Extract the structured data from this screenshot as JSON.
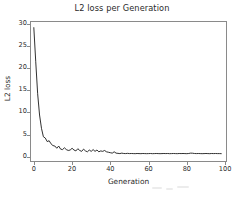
{
  "chart_data": {
    "type": "line",
    "title": "L2 loss per Generation",
    "xlabel": "Generation",
    "ylabel": "L2 loss",
    "grid": false,
    "legend": null,
    "line_color": "#1a1a1a",
    "background_color": "#ffffff",
    "axis_color": "#8a8a8a",
    "xlim": [
      -2,
      101
    ],
    "ylim": [
      -1.2,
      30.6
    ],
    "xticks": [
      0,
      20,
      40,
      60,
      80,
      100
    ],
    "xtick_labels": [
      "0",
      "20",
      "40",
      "60",
      "80",
      "100"
    ],
    "yticks": [
      0,
      5,
      10,
      15,
      20,
      25,
      30
    ],
    "ytick_labels": [
      "0",
      "5",
      "10",
      "15",
      "20",
      "25",
      "30"
    ],
    "series": [
      {
        "name": "L2 loss",
        "x": [
          0,
          1,
          2,
          3,
          4,
          5,
          6,
          7,
          8,
          9,
          10,
          11,
          12,
          13,
          14,
          15,
          16,
          17,
          18,
          19,
          20,
          21,
          22,
          23,
          24,
          25,
          26,
          27,
          28,
          29,
          30,
          31,
          32,
          33,
          34,
          35,
          36,
          37,
          38,
          39,
          40,
          41,
          42,
          43,
          44,
          45,
          46,
          47,
          48,
          49,
          50,
          51,
          52,
          53,
          54,
          55,
          56,
          57,
          58,
          59,
          60,
          61,
          62,
          63,
          64,
          65,
          66,
          67,
          68,
          69,
          70,
          71,
          72,
          73,
          74,
          75,
          76,
          77,
          78,
          79,
          80,
          81,
          82,
          83,
          84,
          85,
          86,
          87,
          88,
          89,
          90,
          91,
          92,
          93,
          94,
          95,
          96,
          97,
          98
        ],
        "y": [
          29.1,
          21.4,
          14.2,
          9.4,
          6.4,
          4.5,
          4.2,
          3.4,
          3.6,
          2.9,
          2.5,
          2.4,
          1.9,
          2.4,
          1.7,
          1.6,
          2.0,
          1.6,
          1.4,
          1.5,
          1.9,
          1.5,
          1.3,
          1.8,
          1.4,
          1.2,
          1.7,
          1.3,
          1.1,
          1.5,
          1.2,
          1.6,
          1.2,
          1.5,
          1.1,
          1.3,
          1.2,
          1.4,
          1.1,
          1.0,
          0.9,
          0.8,
          1.1,
          0.8,
          0.75,
          0.7,
          0.8,
          0.72,
          0.7,
          0.75,
          0.7,
          0.72,
          0.7,
          0.68,
          0.72,
          0.7,
          0.68,
          0.72,
          0.7,
          0.68,
          0.7,
          0.72,
          0.68,
          0.7,
          0.72,
          0.7,
          0.68,
          0.7,
          0.72,
          0.7,
          0.72,
          0.68,
          0.7,
          0.72,
          0.7,
          0.68,
          0.72,
          0.7,
          0.72,
          0.7,
          0.68,
          0.72,
          0.8,
          0.78,
          0.72,
          0.7,
          0.72,
          0.7,
          0.68,
          0.7,
          0.72,
          0.7,
          0.68,
          0.72,
          0.7,
          0.72,
          0.7,
          0.7,
          0.68
        ]
      }
    ]
  }
}
